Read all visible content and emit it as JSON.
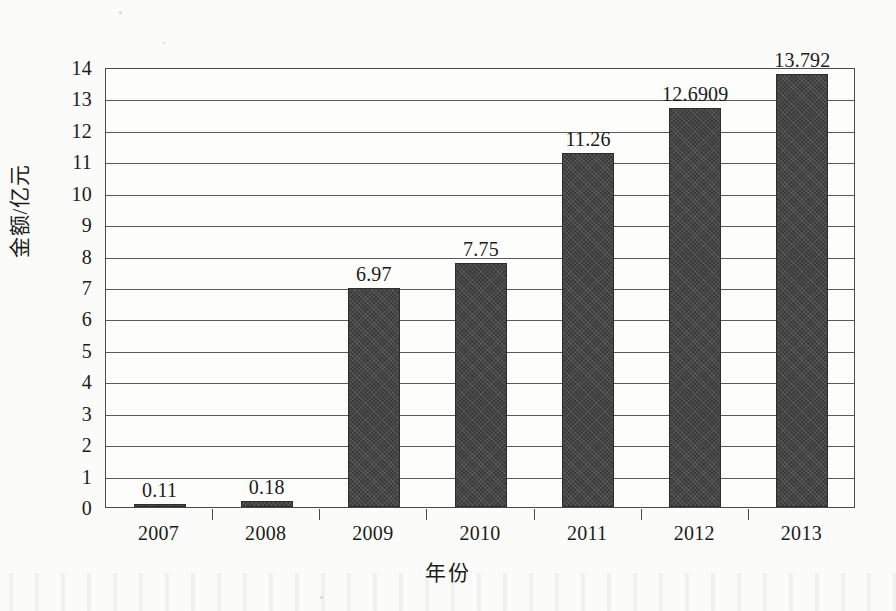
{
  "chart_data": {
    "type": "bar",
    "title": "",
    "subtitle": "",
    "xlabel": "年份",
    "ylabel": "金额/亿元",
    "categories": [
      "2007",
      "2008",
      "2009",
      "2010",
      "2011",
      "2012",
      "2013"
    ],
    "values": [
      0.11,
      0.18,
      6.97,
      7.75,
      11.26,
      12.6909,
      13.792
    ],
    "data_labels": [
      "0.11",
      "0.18",
      "6.97",
      "7.75",
      "11.26",
      "12.6909",
      "13.792"
    ],
    "ylim": [
      0,
      14
    ],
    "ytick_labels": [
      "0",
      "1",
      "2",
      "3",
      "4",
      "5",
      "6",
      "7",
      "8",
      "9",
      "10",
      "11",
      "12",
      "13",
      "14"
    ],
    "ytick_values": [
      0,
      1,
      2,
      3,
      4,
      5,
      6,
      7,
      8,
      9,
      10,
      11,
      12,
      13,
      14
    ],
    "grid": "horizontal",
    "legend": "none",
    "series": [
      {
        "name": "金额",
        "values": [
          0.11,
          0.18,
          6.97,
          7.75,
          11.26,
          12.6909,
          13.792
        ],
        "color": "#3b3b3b"
      }
    ],
    "colors": {
      "bar_fill": "#3b3b3b",
      "bar_edge": "#2c2c2c",
      "gridline": "#5a5a5a",
      "axis": "#4a4a4a",
      "background": "#fbfbf9",
      "plot_background": "#fdfdfc",
      "text": "#1b1b1b"
    }
  }
}
